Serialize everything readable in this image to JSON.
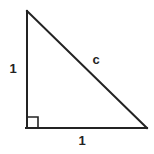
{
  "figure": {
    "kind": "right-triangle-diagram",
    "background_color": "#ffffff",
    "stroke_color": "#232323",
    "stroke_width": 2,
    "label_color": "#232323",
    "canvas": {
      "width": 154,
      "height": 154
    },
    "vertices": {
      "top": {
        "x": 27,
        "y": 11
      },
      "bottom_left": {
        "x": 27,
        "y": 128
      },
      "bottom_right": {
        "x": 147,
        "y": 128
      }
    },
    "right_angle_marker": {
      "at_vertex": "bottom_left",
      "size": 11,
      "shown": true
    },
    "labels": {
      "vertical_leg": "1",
      "horizontal_leg": "1",
      "hypotenuse": "c"
    }
  }
}
